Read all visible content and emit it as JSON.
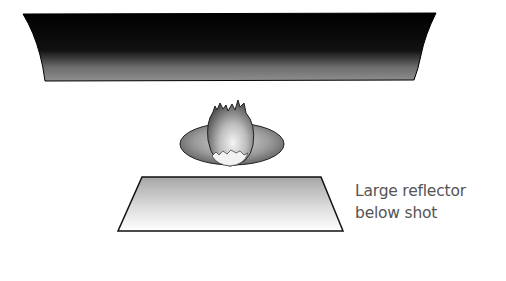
{
  "diagram": {
    "elements": [
      {
        "id": "overhead-softbox",
        "type": "dark panel above subject"
      },
      {
        "id": "subject",
        "type": "egg / food item on plate"
      },
      {
        "id": "plate",
        "type": "elliptical plate"
      },
      {
        "id": "reflector",
        "type": "large reflector below shot"
      }
    ],
    "label": {
      "line1": "Large reflector",
      "line2": "below shot"
    },
    "colors": {
      "panel": "#000000",
      "panel_edge": "#8a8a8a",
      "reflector_top": "#a9a9a9",
      "reflector_bottom": "#ffffff",
      "text": "#555555"
    }
  }
}
